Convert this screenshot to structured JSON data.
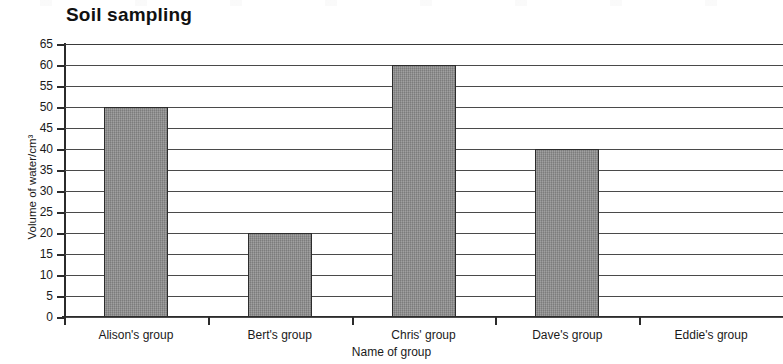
{
  "chart_data": {
    "type": "bar",
    "title": "Soil sampling",
    "xlabel": "Name of group",
    "ylabel": "Volume of water/cm³",
    "categories": [
      "Alison's group",
      "Bert's group",
      "Chris' group",
      "Dave's group",
      "Eddie's group"
    ],
    "values": [
      50,
      20,
      60,
      40,
      0
    ],
    "ylim": [
      0,
      65
    ],
    "ytick_step": 5,
    "yticks": [
      0,
      5,
      10,
      15,
      20,
      25,
      30,
      35,
      40,
      45,
      50,
      55,
      60,
      65
    ],
    "ytick_labels": [
      "0",
      "5",
      "10",
      "15",
      "20",
      "25",
      "30",
      "35",
      "40",
      "45",
      "50",
      "55",
      "60",
      "65"
    ],
    "grid": true,
    "grid_axis": "y",
    "legend": false,
    "bar_color": "#8d8d8d",
    "bar_edge_color": "#2c2c2c",
    "axis_color": "#2b2b2b",
    "background_color": "#ffffff"
  }
}
